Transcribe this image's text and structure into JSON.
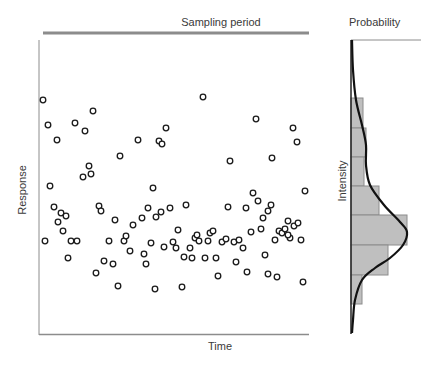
{
  "labels": {
    "sampling_period": "Sampling period",
    "probability": "Probability",
    "x_axis": "Time",
    "y_axis": "Response",
    "hist_axis": "Intensity"
  },
  "colors": {
    "axis": "#8c8c8c",
    "sampling_bar": "#8c8c8c",
    "point_stroke": "#1a1a1a",
    "hist_fill": "#bfbfbf",
    "hist_stroke": "#8c8c8c",
    "curve": "#111111"
  },
  "chart_data": [
    {
      "type": "scatter",
      "title": "Sampling period",
      "xlabel": "Time",
      "ylabel": "Response",
      "grid": false,
      "note": "pixel coordinates (x right, y down); no numeric ticks shown",
      "points": [
        [
          43,
          100
        ],
        [
          48,
          125
        ],
        [
          57,
          140
        ],
        [
          50,
          186
        ],
        [
          54,
          207
        ],
        [
          61,
          213
        ],
        [
          45,
          241
        ],
        [
          58,
          222
        ],
        [
          66,
          216
        ],
        [
          63,
          231
        ],
        [
          71,
          241
        ],
        [
          77,
          241
        ],
        [
          68,
          258
        ],
        [
          75,
          123
        ],
        [
          83,
          177
        ],
        [
          89,
          166
        ],
        [
          91,
          174
        ],
        [
          93,
          111
        ],
        [
          85,
          131
        ],
        [
          99,
          206
        ],
        [
          101,
          211
        ],
        [
          96,
          273
        ],
        [
          109,
          241
        ],
        [
          104,
          261
        ],
        [
          113,
          264
        ],
        [
          115,
          220
        ],
        [
          120,
          156
        ],
        [
          118,
          286
        ],
        [
          124,
          241
        ],
        [
          126,
          236
        ],
        [
          130,
          251
        ],
        [
          133,
          225
        ],
        [
          138,
          140
        ],
        [
          142,
          218
        ],
        [
          144,
          254
        ],
        [
          146,
          264
        ],
        [
          153,
          188
        ],
        [
          148,
          208
        ],
        [
          155,
          289
        ],
        [
          151,
          243
        ],
        [
          156,
          217
        ],
        [
          159,
          141
        ],
        [
          161,
          212
        ],
        [
          164,
          247
        ],
        [
          162,
          144
        ],
        [
          166,
          128
        ],
        [
          170,
          208
        ],
        [
          173,
          242
        ],
        [
          176,
          248
        ],
        [
          178,
          230
        ],
        [
          182,
          287
        ],
        [
          186,
          205
        ],
        [
          184,
          257
        ],
        [
          190,
          248
        ],
        [
          192,
          258
        ],
        [
          195,
          238
        ],
        [
          197,
          235
        ],
        [
          199,
          241
        ],
        [
          203,
          97
        ],
        [
          205,
          258
        ],
        [
          208,
          241
        ],
        [
          210,
          233
        ],
        [
          213,
          231
        ],
        [
          216,
          258
        ],
        [
          218,
          276
        ],
        [
          222,
          242
        ],
        [
          228,
          207
        ],
        [
          230,
          161
        ],
        [
          226,
          239
        ],
        [
          234,
          242
        ],
        [
          239,
          240
        ],
        [
          236,
          262
        ],
        [
          243,
          248
        ],
        [
          246,
          208
        ],
        [
          247,
          272
        ],
        [
          251,
          232
        ],
        [
          253,
          193
        ],
        [
          256,
          119
        ],
        [
          258,
          201
        ],
        [
          261,
          229
        ],
        [
          263,
          218
        ],
        [
          265,
          255
        ],
        [
          268,
          211
        ],
        [
          268,
          274
        ],
        [
          271,
          205
        ],
        [
          272,
          158
        ],
        [
          275,
          240
        ],
        [
          279,
          231
        ],
        [
          277,
          277
        ],
        [
          282,
          233
        ],
        [
          285,
          229
        ],
        [
          288,
          221
        ],
        [
          290,
          238
        ],
        [
          288,
          235
        ],
        [
          293,
          128
        ],
        [
          294,
          226
        ],
        [
          298,
          223
        ],
        [
          301,
          240
        ],
        [
          305,
          191
        ],
        [
          303,
          282
        ],
        [
          297,
          142
        ]
      ]
    },
    {
      "type": "bar",
      "orientation": "horizontal",
      "title": "Probability",
      "ylabel": "Intensity",
      "note": "histogram bins ordered top to bottom with relative widths, overlaid with density curve",
      "bins": [
        {
          "y0": 98,
          "y1": 128,
          "width": 12
        },
        {
          "y0": 128,
          "y1": 157,
          "width": 15
        },
        {
          "y0": 157,
          "y1": 186,
          "width": 13
        },
        {
          "y0": 186,
          "y1": 215,
          "width": 28
        },
        {
          "y0": 215,
          "y1": 245,
          "width": 56
        },
        {
          "y0": 245,
          "y1": 275,
          "width": 37
        },
        {
          "y0": 275,
          "y1": 304,
          "width": 11
        }
      ],
      "curve": [
        [
          352,
          40
        ],
        [
          353,
          70
        ],
        [
          356,
          100
        ],
        [
          362,
          125
        ],
        [
          366,
          145
        ],
        [
          366,
          165
        ],
        [
          370,
          185
        ],
        [
          384,
          205
        ],
        [
          400,
          222
        ],
        [
          407,
          232
        ],
        [
          403,
          245
        ],
        [
          390,
          258
        ],
        [
          375,
          268
        ],
        [
          362,
          280
        ],
        [
          355,
          300
        ],
        [
          353,
          320
        ],
        [
          352,
          333
        ]
      ]
    }
  ]
}
